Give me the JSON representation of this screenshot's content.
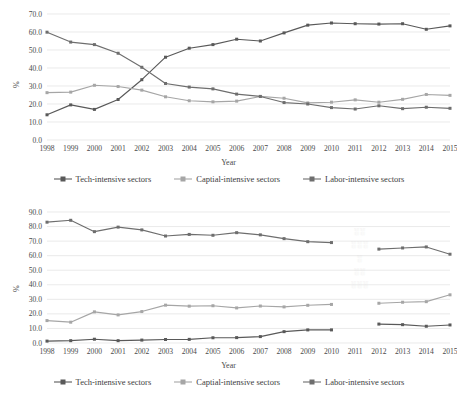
{
  "figure": {
    "series_names": {
      "tech": "Tech-intensive sectors",
      "capital": "Captial-intensive sectors",
      "labor": "Labor-intensive sectors"
    },
    "colors": {
      "tech": "#595959",
      "capital": "#a6a6a6",
      "labor": "#6e6e6e",
      "grid": "#dcdcdc",
      "text": "#4a4a4a",
      "background": "#ffffff"
    },
    "ghost_artifact": "scan-residue"
  },
  "chart_data": [
    {
      "type": "line",
      "title": "",
      "xlabel": "Year",
      "ylabel": "%",
      "grid": true,
      "legend_position": "bottom",
      "ylim": [
        0,
        70
      ],
      "ytick_labels": [
        "70.0",
        "60.0",
        "50.0",
        "40.0",
        "30.0",
        "20.0",
        "10.0",
        "0.0"
      ],
      "ytick_values": [
        70,
        60,
        50,
        40,
        30,
        20,
        10,
        0
      ],
      "categories": [
        "1998",
        "1999",
        "2000",
        "2001",
        "2002",
        "2003",
        "2004",
        "2005",
        "2006",
        "2007",
        "2008",
        "2009",
        "2010",
        "2011",
        "2012",
        "2013",
        "2014",
        "2015"
      ],
      "series": [
        {
          "name": "Tech-intensive sectors",
          "key": "tech",
          "values": [
            14.0,
            19.5,
            17.0,
            22.5,
            33.5,
            46.0,
            51.0,
            53.0,
            56.0,
            55.0,
            59.5,
            63.8,
            65.0,
            64.6,
            64.4,
            64.6,
            61.5,
            63.4
          ]
        },
        {
          "name": "Captial-intensive sectors",
          "key": "capital",
          "values": [
            26.3,
            26.6,
            30.4,
            29.7,
            27.7,
            24.0,
            21.8,
            21.2,
            21.6,
            24.2,
            23.2,
            20.6,
            21.0,
            22.3,
            21.0,
            22.6,
            25.3,
            24.8
          ]
        },
        {
          "name": "Labor-intensive sectors",
          "key": "labor",
          "values": [
            59.9,
            54.4,
            53.0,
            48.2,
            40.4,
            31.4,
            29.4,
            28.4,
            25.5,
            24.2,
            20.8,
            20.0,
            18.0,
            17.2,
            19.0,
            17.4,
            18.2,
            17.6
          ]
        }
      ]
    },
    {
      "type": "line",
      "title": "",
      "xlabel": "Year",
      "ylabel": "%",
      "grid": true,
      "legend_position": "bottom",
      "ylim": [
        0,
        90
      ],
      "ytick_labels": [
        "90.0",
        "80.0",
        "70.0",
        "60.0",
        "50.0",
        "40.0",
        "30.0",
        "20.0",
        "10.0",
        "0.0"
      ],
      "ytick_values": [
        90,
        80,
        70,
        60,
        50,
        40,
        30,
        20,
        10,
        0
      ],
      "categories": [
        "1998",
        "1999",
        "2000",
        "2001",
        "2002",
        "2003",
        "2004",
        "2005",
        "2006",
        "2007",
        "2008",
        "2009",
        "2010",
        "2011",
        "2012",
        "2013",
        "2014",
        "2015"
      ],
      "note": "no data plotted for 2011 (gap in all series)",
      "series": [
        {
          "name": "Tech-intensive sectors",
          "key": "tech",
          "values": [
            1.3,
            1.6,
            2.6,
            1.6,
            2.0,
            2.4,
            2.5,
            3.6,
            3.7,
            4.4,
            7.8,
            9.0,
            9.0,
            null,
            13.0,
            12.6,
            11.5,
            12.4
          ]
        },
        {
          "name": "Captial-intensive sectors",
          "key": "capital",
          "values": [
            15.4,
            14.3,
            21.4,
            19.3,
            21.6,
            26.0,
            25.3,
            25.6,
            24.1,
            25.4,
            24.8,
            25.9,
            26.5,
            null,
            27.3,
            28.0,
            28.4,
            33.1
          ]
        },
        {
          "name": "Labor-intensive sectors",
          "key": "labor",
          "values": [
            83.0,
            84.3,
            76.5,
            79.6,
            77.7,
            73.5,
            74.6,
            74.0,
            75.8,
            74.3,
            71.7,
            69.6,
            69.0,
            null,
            64.5,
            65.3,
            66.0,
            61.0
          ]
        }
      ]
    }
  ]
}
